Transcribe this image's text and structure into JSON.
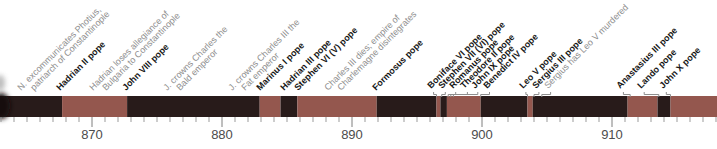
{
  "chart_data": {
    "type": "timeline",
    "axis": {
      "unit": "year",
      "min": 863,
      "max": 918,
      "minor_tick_interval": 1,
      "major_tick_interval": 10,
      "major_ticks": [
        {
          "year": 870,
          "label": "870"
        },
        {
          "year": 880,
          "label": "880"
        },
        {
          "year": 890,
          "label": "890"
        },
        {
          "year": 900,
          "label": "900"
        },
        {
          "year": 910,
          "label": "910"
        }
      ],
      "grid": false
    },
    "scale": {
      "x_at_year_870": 92,
      "px_per_year": 13
    },
    "bar": {
      "top": 96,
      "height": 21
    },
    "colors": {
      "background": "#ffffff",
      "segment_dark": "#281b1a",
      "segment_light": "#94574e",
      "pope_label": "#161616",
      "event_label": "#8e8e8e",
      "axis_label": "#4c4c4c",
      "minor_tick": "#9b9b9b",
      "major_tick": "#7f7f7f",
      "leader": "#8f8f8f",
      "edge_blur_dark": "#140c0d",
      "edge_blur_grey": "#9a9a9a"
    },
    "segments": [
      {
        "start": 862.9,
        "end": 867.7,
        "shade": "dark"
      },
      {
        "start": 867.7,
        "end": 872.7,
        "shade": "light"
      },
      {
        "start": 872.7,
        "end": 882.9,
        "shade": "dark"
      },
      {
        "start": 882.9,
        "end": 884.5,
        "shade": "light"
      },
      {
        "start": 884.5,
        "end": 885.8,
        "shade": "dark"
      },
      {
        "start": 885.8,
        "end": 891.9,
        "shade": "light"
      },
      {
        "start": 891.9,
        "end": 896.5,
        "shade": "dark"
      },
      {
        "start": 896.5,
        "end": 896.8,
        "shade": "light"
      },
      {
        "start": 896.8,
        "end": 897.3,
        "shade": "dark"
      },
      {
        "start": 897.3,
        "end": 899.9,
        "shade": "light"
      },
      {
        "start": 899.9,
        "end": 903.5,
        "shade": "dark"
      },
      {
        "start": 903.5,
        "end": 903.9,
        "shade": "light"
      },
      {
        "start": 903.9,
        "end": 911.2,
        "shade": "dark"
      },
      {
        "start": 911.2,
        "end": 913.5,
        "shade": "light"
      },
      {
        "start": 913.5,
        "end": 914.5,
        "shade": "dark"
      },
      {
        "start": 914.5,
        "end": 918.1,
        "shade": "light"
      }
    ],
    "labels": [
      {
        "lines": [
          "N. excommunicates Photius,",
          "patriarch of Constantinople"
        ],
        "kind": "event",
        "text_year": 864.7
      },
      {
        "lines": [
          "Hadrian II pope"
        ],
        "kind": "pope",
        "text_year": 867.7
      },
      {
        "lines": [
          "Hadrian loses allegiance of",
          "Bulgaria to Constantinople"
        ],
        "kind": "event",
        "text_year": 870.2
      },
      {
        "lines": [
          "John VIII pope"
        ],
        "kind": "pope",
        "text_year": 872.8
      },
      {
        "lines": [
          "J. crowns Charles the",
          "Bald emperor"
        ],
        "kind": "event",
        "text_year": 875.9
      },
      {
        "lines": [
          "J. crowns Charles III the",
          "Fat emperor"
        ],
        "kind": "event",
        "text_year": 880.9
      },
      {
        "lines": [
          "Marinus I pope"
        ],
        "kind": "pope",
        "text_year": 883.1
      },
      {
        "lines": [
          "Hadrian III pope"
        ],
        "kind": "pope",
        "text_year": 884.9
      },
      {
        "lines": [
          "Stephen VI (V) pope"
        ],
        "kind": "pope",
        "text_year": 886.0
      },
      {
        "lines": [
          "Charles III dies; empire of",
          "Charlemagne disintegrates"
        ],
        "kind": "event",
        "text_year": 888.3
      },
      {
        "lines": [
          "Formosus pope"
        ],
        "kind": "pope",
        "text_year": 892.0
      },
      {
        "lines": [
          "Boniface VI pope"
        ],
        "kind": "pope",
        "text_year": 896.2,
        "leader_year": 896.5
      },
      {
        "lines": [
          "Stephen VII (VI) pope"
        ],
        "kind": "pope",
        "text_year": 897.1,
        "leader_year": 896.9
      },
      {
        "lines": [
          "Romanus pope"
        ],
        "kind": "pope",
        "text_year": 897.9,
        "leader_year": 897.4
      },
      {
        "lines": [
          "Theodore II pope"
        ],
        "kind": "pope",
        "text_year": 898.8,
        "leader_year": 897.6
      },
      {
        "lines": [
          "John IX pope"
        ],
        "kind": "pope",
        "text_year": 899.6,
        "leader_year": 897.8
      },
      {
        "lines": [
          "Benedict IV pope"
        ],
        "kind": "pope",
        "text_year": 900.5,
        "leader_year": 899.9
      },
      {
        "lines": [
          "Leo V pope"
        ],
        "kind": "pope",
        "text_year": 903.3,
        "leader_year": 903.5
      },
      {
        "lines": [
          "Sergius III pope"
        ],
        "kind": "pope",
        "text_year": 904.3,
        "leader_year": 904.0
      },
      {
        "lines": [
          "Sergius has Leo V murdered"
        ],
        "kind": "event",
        "text_year": 905.2,
        "leader_year": 904.6
      },
      {
        "lines": [
          "Anastasius III pope"
        ],
        "kind": "pope",
        "text_year": 910.8,
        "leader_year": 911.4
      },
      {
        "lines": [
          "Lando pope"
        ],
        "kind": "pope",
        "text_year": 912.4,
        "leader_year": 913.6
      },
      {
        "lines": [
          "John X pope"
        ],
        "kind": "pope",
        "text_year": 914.1,
        "leader_year": 914.5
      }
    ]
  }
}
